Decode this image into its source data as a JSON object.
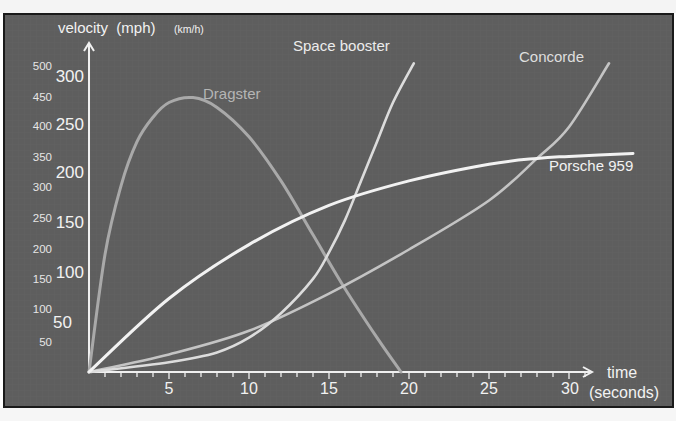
{
  "chart_data": {
    "type": "line",
    "title": "",
    "xlabel": "time (seconds)",
    "ylabel": "velocity (mph) (km/h)",
    "xlim": [
      0,
      35
    ],
    "ylim": [
      0,
      300
    ],
    "x_ticks": [
      5,
      10,
      15,
      20,
      25,
      30
    ],
    "y_ticks_mph": [
      50,
      100,
      150,
      200,
      250,
      300
    ],
    "y_ticks_kmh": [
      50,
      100,
      150,
      200,
      250,
      300,
      350,
      400,
      450,
      500
    ],
    "grid": true,
    "legend": "inline labels",
    "series": [
      {
        "name": "Dragster",
        "x": [
          0,
          1,
          2,
          3,
          4,
          5,
          6.5,
          8,
          10,
          12,
          14,
          16,
          18,
          19.5
        ],
        "y": [
          0,
          120,
          190,
          235,
          260,
          275,
          280,
          270,
          240,
          195,
          140,
          85,
          35,
          0
        ]
      },
      {
        "name": "Space booster",
        "x": [
          0,
          5,
          8,
          10,
          12,
          14,
          15,
          16,
          17,
          18,
          19,
          20.3
        ],
        "y": [
          0,
          10,
          20,
          35,
          60,
          95,
          122,
          155,
          195,
          235,
          275,
          315
        ]
      },
      {
        "name": "Concorde",
        "x": [
          0,
          5,
          10,
          15,
          20,
          25,
          28,
          30,
          32.5
        ],
        "y": [
          0,
          18,
          42,
          80,
          125,
          175,
          218,
          250,
          315
        ]
      },
      {
        "name": "Porsche 959",
        "x": [
          0,
          5,
          10,
          15,
          20,
          25,
          28,
          30,
          34
        ],
        "y": [
          0,
          75,
          130,
          170,
          195,
          212,
          218,
          220,
          223
        ]
      }
    ]
  },
  "labels": {
    "ylabel_main": "velocity  (mph)",
    "ylabel_unit2": "(km/h)",
    "xlabel_line1": "time",
    "xlabel_line2": "(seconds)",
    "series_dragster": "Dragster",
    "series_space": "Space booster",
    "series_concorde": "Concorde",
    "series_porsche": "Porsche 959"
  },
  "ticks": {
    "mph": [
      "300",
      "250",
      "200",
      "150",
      "100",
      "50"
    ],
    "kmh": [
      "500",
      "450",
      "400",
      "350",
      "300",
      "250",
      "200",
      "150",
      "100",
      "50"
    ],
    "x": [
      "5",
      "10",
      "15",
      "20",
      "25",
      "30"
    ]
  },
  "colors": {
    "panel_bg": "#5e5e5e",
    "axis": "#f0f0f0",
    "dragster": "#a9a9a9",
    "space_booster": "#dcdcdc",
    "concorde": "#c4c4c4",
    "porsche": "#f2f2f2",
    "label_text": "#eeeeee",
    "dragster_label": "#b5b5b5"
  }
}
